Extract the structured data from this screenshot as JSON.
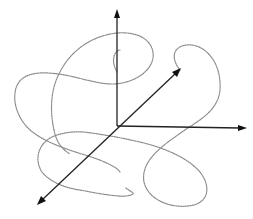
{
  "diagram": {
    "colors": {
      "background": "#ffffff",
      "axis": "#222222",
      "curve": "#8a8a8a"
    },
    "origin": [
      117,
      126
    ],
    "axes": [
      {
        "name": "vertical-axis",
        "from": [
          117,
          126
        ],
        "to": [
          117,
          11
        ]
      },
      {
        "name": "horizontal-axis",
        "from": [
          117,
          126
        ],
        "to": [
          246,
          128
        ]
      },
      {
        "name": "diagonal-axis-front",
        "from": [
          117,
          126
        ],
        "to": [
          38,
          204
        ]
      },
      {
        "name": "diagonal-axis-back",
        "from": [
          117,
          126
        ],
        "to": [
          180,
          69
        ]
      }
    ],
    "curve_style": "dotted"
  }
}
